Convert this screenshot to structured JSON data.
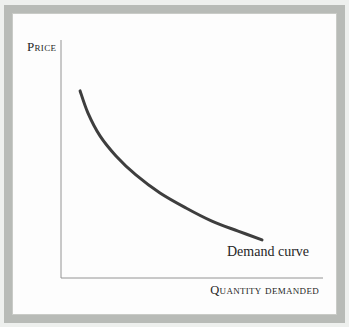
{
  "figure": {
    "ylabel": "Price",
    "xlabel": "Quantity demanded",
    "annotation": "Demand curve"
  },
  "chart_data": {
    "type": "line",
    "title": "",
    "xlabel": "Quantity demanded",
    "ylabel": "Price",
    "grid": false,
    "legend": false,
    "axis_tick_labels": [],
    "annotations": [
      {
        "text": "Demand curve",
        "anchor": "below-right-end-of-curve"
      }
    ],
    "series": [
      {
        "name": "Demand curve",
        "shape": "convex decreasing (price falls as quantity demanded rises)",
        "points_norm": [
          [
            0.073,
            0.786
          ],
          [
            0.103,
            0.693
          ],
          [
            0.149,
            0.597
          ],
          [
            0.21,
            0.513
          ],
          [
            0.286,
            0.433
          ],
          [
            0.378,
            0.357
          ],
          [
            0.477,
            0.294
          ],
          [
            0.576,
            0.239
          ],
          [
            0.676,
            0.197
          ],
          [
            0.767,
            0.16
          ]
        ]
      }
    ],
    "colors": {
      "curve": "#3e3e3e",
      "axis": "#949494",
      "text": "#262626",
      "frame": "#b8bbb7",
      "panel": "#fdfdfd",
      "page_background": "#eef0ee"
    }
  }
}
